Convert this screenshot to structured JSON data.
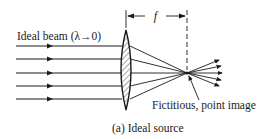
{
  "diagram": {
    "beam_label": "Ideal beam (λ→0)",
    "focal_label": "f",
    "image_label": "Fictitious, point image",
    "caption": "(a) Ideal source",
    "colors": {
      "ink": "#1a1a1a",
      "background": "#ffffff"
    },
    "rays": [
      46,
      59,
      73,
      86,
      99
    ],
    "lens": {
      "x": 126,
      "top": 30,
      "bottom": 110
    },
    "focal_point": {
      "x": 187,
      "y": 73
    }
  }
}
